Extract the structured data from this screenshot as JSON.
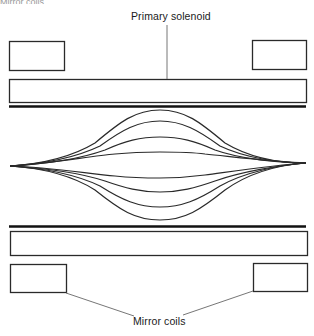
{
  "diagram": {
    "caption_fragment": "Mirror coils",
    "labels": {
      "primary_solenoid": "Primary solenoid",
      "mirror_coils": "Mirror coils"
    },
    "colors": {
      "stroke": "#2a2a2a",
      "thick_line": "#111111",
      "leader_line": "#666666",
      "background": "#ffffff"
    },
    "components": {
      "mirror_coils": [
        {
          "id": "top-left",
          "x": 9,
          "y": 41,
          "w": 55,
          "h": 29
        },
        {
          "id": "top-right",
          "x": 252,
          "y": 40,
          "w": 54,
          "h": 29
        },
        {
          "id": "bottom-left",
          "x": 10,
          "y": 264,
          "w": 56,
          "h": 28
        },
        {
          "id": "bottom-right",
          "x": 253,
          "y": 263,
          "w": 54,
          "h": 28
        }
      ],
      "primary_solenoid": [
        {
          "id": "top",
          "x": 9,
          "y": 79,
          "w": 297,
          "h": 23
        },
        {
          "id": "bottom",
          "x": 10,
          "y": 231,
          "w": 297,
          "h": 24
        }
      ],
      "vessel_walls": [
        {
          "id": "top",
          "x1": 9,
          "x2": 306,
          "y": 106
        },
        {
          "id": "bottom",
          "x1": 9,
          "x2": 306,
          "y": 226
        }
      ]
    },
    "field_lines": {
      "left_focus": {
        "x": 10,
        "y": 166
      },
      "right_focus": {
        "x": 306,
        "y": 163
      },
      "center_x": 160,
      "count": 8,
      "center_y_values": [
        110,
        121,
        137,
        152,
        178,
        192,
        207,
        220
      ]
    }
  }
}
